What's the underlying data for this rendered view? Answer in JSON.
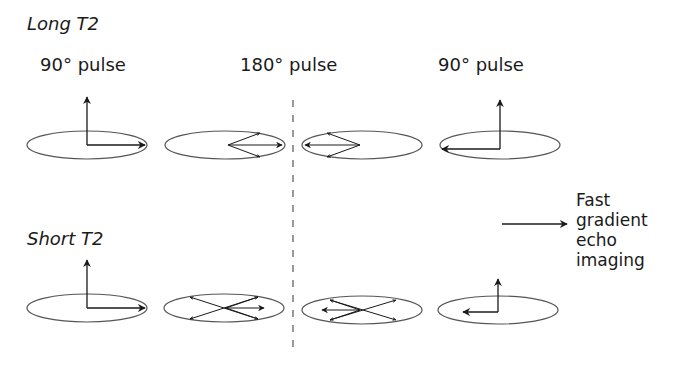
{
  "rows": [
    {
      "label": "Long T2"
    },
    {
      "label": "Short T2"
    }
  ],
  "pulses": [
    {
      "label": "90° pulse"
    },
    {
      "label": "180° pulse"
    },
    {
      "label": "90° pulse"
    }
  ],
  "output": {
    "lines": [
      "Fast",
      "gradient",
      "echo",
      "imaging"
    ]
  },
  "colors": {
    "line": "#1a1a1a",
    "ellipse": "#555555",
    "dash": "#555555"
  }
}
